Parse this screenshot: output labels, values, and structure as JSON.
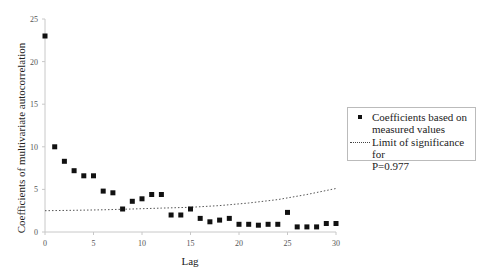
{
  "chart_data": {
    "type": "scatter",
    "title": "",
    "xlabel": "Lag",
    "ylabel": "Coefficients of multivariate autocorrelation",
    "xlim": [
      0,
      30
    ],
    "ylim": [
      0,
      25
    ],
    "xticks": [
      0,
      5,
      10,
      15,
      20,
      25,
      30
    ],
    "yticks": [
      0,
      5,
      10,
      15,
      20,
      25
    ],
    "grid": false,
    "legend_position": "right",
    "series": [
      {
        "name": "Coefficients based on measured values",
        "type": "scatter",
        "marker": "square",
        "color": "#111111",
        "x": [
          0,
          1,
          2,
          3,
          4,
          5,
          6,
          7,
          8,
          9,
          10,
          11,
          12,
          13,
          14,
          15,
          16,
          17,
          18,
          19,
          20,
          21,
          22,
          23,
          24,
          25,
          26,
          27,
          28,
          29,
          30
        ],
        "values": [
          23.0,
          10.0,
          8.3,
          7.2,
          6.6,
          6.6,
          4.8,
          4.6,
          2.7,
          3.6,
          3.9,
          4.4,
          4.4,
          2.0,
          2.0,
          2.7,
          1.6,
          1.2,
          1.4,
          1.6,
          0.9,
          0.9,
          0.8,
          0.9,
          0.9,
          2.3,
          0.6,
          0.6,
          0.6,
          1.0,
          1.0
        ]
      },
      {
        "name": "Limit of significance for P=0.977",
        "type": "line",
        "style": "dotted",
        "color": "#444444",
        "x": [
          0,
          3,
          6,
          9,
          12,
          15,
          18,
          21,
          24,
          27,
          30
        ],
        "values": [
          2.5,
          2.55,
          2.6,
          2.7,
          2.8,
          2.9,
          3.1,
          3.4,
          3.8,
          4.4,
          5.1
        ]
      }
    ]
  },
  "legend": {
    "items": [
      {
        "label_line1": "Coefficients based on",
        "label_line2": "measured values"
      },
      {
        "label_line1": "Limit of significance for",
        "label_line2": "P=0.977"
      }
    ]
  }
}
